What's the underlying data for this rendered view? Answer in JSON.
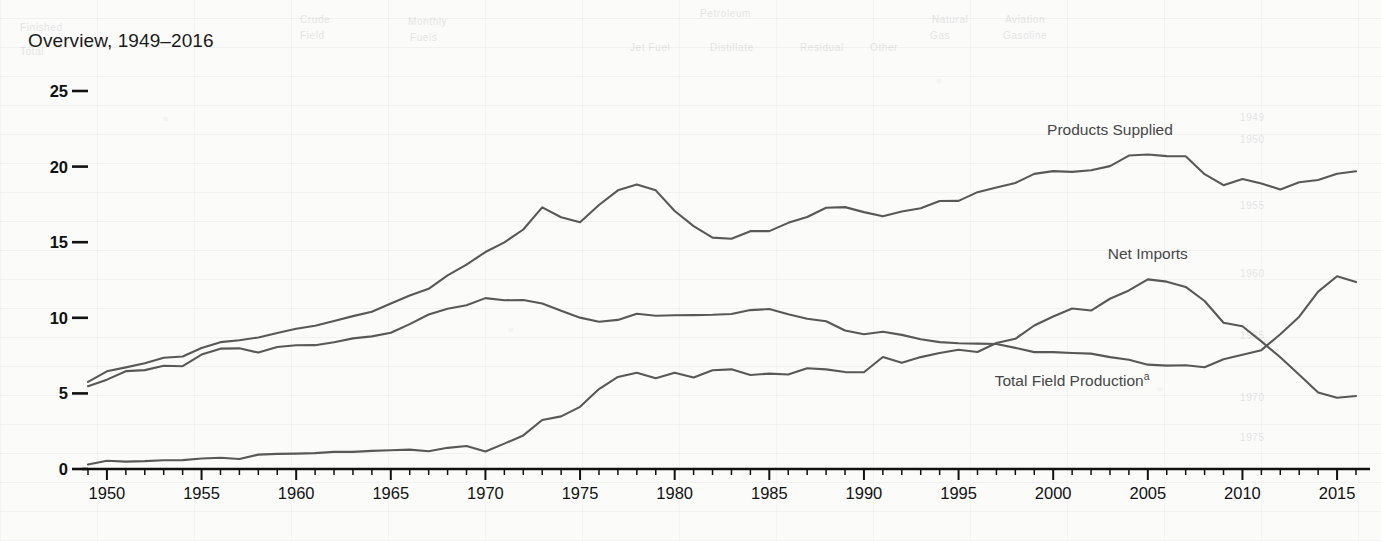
{
  "title": "Overview, 1949–2016",
  "labels": {
    "products_supplied": "Products Supplied",
    "net_imports": "Net Imports",
    "total_field_production": "Total Field Production",
    "total_field_production_footnote": "a"
  },
  "axes": {
    "y_ticks": [
      "0",
      "5",
      "10",
      "15",
      "20",
      "25"
    ],
    "x_ticks": [
      "1950",
      "1955",
      "1960",
      "1965",
      "1970",
      "1975",
      "1980",
      "1985",
      "1990",
      "1995",
      "2000",
      "2005",
      "2010",
      "2015"
    ]
  },
  "chart_data": {
    "type": "line",
    "title": "Overview, 1949–2016",
    "xlabel": "",
    "ylabel": "",
    "xlim": [
      1949,
      2016
    ],
    "ylim": [
      0,
      25
    ],
    "grid": false,
    "legend": "inline-annotations",
    "x": [
      1949,
      1950,
      1951,
      1952,
      1953,
      1954,
      1955,
      1956,
      1957,
      1958,
      1959,
      1960,
      1961,
      1962,
      1963,
      1964,
      1965,
      1966,
      1967,
      1968,
      1969,
      1970,
      1971,
      1972,
      1973,
      1974,
      1975,
      1976,
      1977,
      1978,
      1979,
      1980,
      1981,
      1982,
      1983,
      1984,
      1985,
      1986,
      1987,
      1988,
      1989,
      1990,
      1991,
      1992,
      1993,
      1994,
      1995,
      1996,
      1997,
      1998,
      1999,
      2000,
      2001,
      2002,
      2003,
      2004,
      2005,
      2006,
      2007,
      2008,
      2009,
      2010,
      2011,
      2012,
      2013,
      2014,
      2015,
      2016
    ],
    "series": [
      {
        "name": "Products Supplied",
        "values": [
          5.76,
          6.46,
          6.72,
          7.0,
          7.36,
          7.44,
          8.0,
          8.39,
          8.52,
          8.7,
          9.0,
          9.28,
          9.47,
          9.79,
          10.11,
          10.4,
          10.95,
          11.48,
          11.92,
          12.8,
          13.52,
          14.35,
          14.99,
          15.84,
          17.3,
          16.65,
          16.32,
          17.46,
          18.43,
          18.81,
          18.43,
          17.06,
          16.06,
          15.3,
          15.23,
          15.73,
          15.73,
          16.28,
          16.67,
          17.28,
          17.32,
          16.99,
          16.71,
          17.03,
          17.24,
          17.72,
          17.73,
          18.31,
          18.62,
          18.92,
          19.52,
          19.7,
          19.65,
          19.76,
          20.03,
          20.73,
          20.8,
          20.69,
          20.68,
          19.5,
          18.77,
          19.18,
          18.88,
          18.49,
          18.96,
          19.11,
          19.53,
          19.69
        ]
      },
      {
        "name": "Total Field Production",
        "values": [
          5.48,
          5.91,
          6.47,
          6.54,
          6.83,
          6.8,
          7.57,
          7.96,
          7.98,
          7.7,
          8.07,
          8.18,
          8.19,
          8.38,
          8.64,
          8.77,
          9.01,
          9.58,
          10.22,
          10.6,
          10.83,
          11.3,
          11.16,
          11.18,
          10.95,
          10.46,
          10.01,
          9.74,
          9.86,
          10.27,
          10.14,
          10.17,
          10.18,
          10.2,
          10.25,
          10.51,
          10.58,
          10.23,
          9.94,
          9.77,
          9.16,
          8.91,
          9.08,
          8.87,
          8.58,
          8.39,
          8.32,
          8.29,
          8.27,
          8.01,
          7.73,
          7.73,
          7.67,
          7.63,
          7.4,
          7.23,
          6.9,
          6.84,
          6.86,
          6.73,
          7.26,
          7.55,
          7.86,
          8.91,
          10.07,
          11.73,
          12.75,
          12.36
        ]
      },
      {
        "name": "Net Imports",
        "values": [
          0.3,
          0.55,
          0.49,
          0.52,
          0.58,
          0.59,
          0.69,
          0.74,
          0.66,
          0.95,
          1.0,
          1.02,
          1.05,
          1.13,
          1.13,
          1.2,
          1.24,
          1.28,
          1.17,
          1.4,
          1.52,
          1.16,
          1.68,
          2.22,
          3.24,
          3.48,
          4.11,
          5.29,
          6.09,
          6.36,
          6.0,
          6.37,
          6.05,
          6.53,
          6.59,
          6.22,
          6.31,
          6.25,
          6.66,
          6.59,
          6.41,
          6.4,
          7.41,
          7.02,
          7.4,
          7.67,
          7.89,
          7.74,
          8.33,
          8.61,
          9.49,
          10.09,
          10.62,
          10.48,
          11.26,
          11.81,
          12.54,
          12.39,
          12.04,
          11.11,
          9.67,
          9.44,
          8.44,
          7.39,
          6.24,
          5.06,
          4.71,
          4.83
        ]
      }
    ],
    "annotations": [
      {
        "text": "Products Supplied",
        "x": 2003,
        "y": 22.1
      },
      {
        "text": "Net Imports",
        "x": 2005,
        "y": 13.9
      },
      {
        "text": "Total Field Production",
        "x": 2001,
        "y": 5.5
      }
    ]
  },
  "ghost_marks": [
    {
      "t": "Crude",
      "x": 300,
      "y": 14
    },
    {
      "t": "Monthly",
      "x": 408,
      "y": 16
    },
    {
      "t": "Petroleum",
      "x": 700,
      "y": 8
    },
    {
      "t": "Natural",
      "x": 932,
      "y": 14
    },
    {
      "t": "Aviation",
      "x": 1005,
      "y": 14
    },
    {
      "t": "Finished",
      "x": 20,
      "y": 22
    },
    {
      "t": "Field",
      "x": 300,
      "y": 30
    },
    {
      "t": "Fuels",
      "x": 410,
      "y": 32
    },
    {
      "t": "Gas",
      "x": 930,
      "y": 30
    },
    {
      "t": "Gasoline",
      "x": 1003,
      "y": 30
    },
    {
      "t": "Jet Fuel",
      "x": 630,
      "y": 42
    },
    {
      "t": "Distillate",
      "x": 710,
      "y": 42
    },
    {
      "t": "Residual",
      "x": 800,
      "y": 42
    },
    {
      "t": "Other",
      "x": 870,
      "y": 42
    },
    {
      "t": "Total",
      "x": 20,
      "y": 46
    },
    {
      "t": "1949",
      "x": 1240,
      "y": 112
    },
    {
      "t": "1950",
      "x": 1240,
      "y": 134
    },
    {
      "t": "1955",
      "x": 1240,
      "y": 200
    },
    {
      "t": "1960",
      "x": 1240,
      "y": 268
    },
    {
      "t": "1965",
      "x": 1240,
      "y": 330
    },
    {
      "t": "1970",
      "x": 1240,
      "y": 392
    },
    {
      "t": "1975",
      "x": 1240,
      "y": 432
    }
  ]
}
